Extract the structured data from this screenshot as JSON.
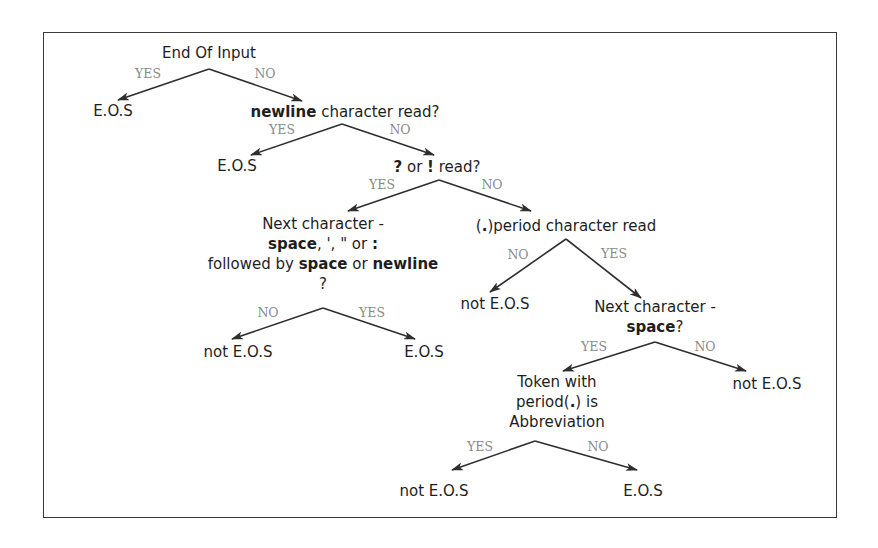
{
  "diagram": {
    "type": "decision-tree",
    "colors": {
      "frame": "#3a3a3a",
      "text": "#1e1e1e",
      "edge_label": "#8a8a8a",
      "edge": "#2e2e2e"
    },
    "nodes": [
      {
        "id": "n_end_of_input",
        "x": 209,
        "y": 43,
        "lines": [
          [
            {
              "t": "End Of Input"
            }
          ]
        ]
      },
      {
        "id": "n_eos_1",
        "x": 113,
        "y": 101,
        "lines": [
          [
            {
              "t": "E.O.S"
            }
          ]
        ]
      },
      {
        "id": "n_newline",
        "x": 345,
        "y": 102,
        "lines": [
          [
            {
              "t": "newline",
              "b": true
            },
            {
              "t": " character read?"
            }
          ]
        ]
      },
      {
        "id": "n_eos_2",
        "x": 237,
        "y": 156,
        "lines": [
          [
            {
              "t": "E.O.S"
            }
          ]
        ]
      },
      {
        "id": "n_qmark_excl",
        "x": 437,
        "y": 157,
        "lines": [
          [
            {
              "t": "?",
              "b": true
            },
            {
              "t": " or "
            },
            {
              "t": "!",
              "b": true
            },
            {
              "t": " read?"
            }
          ]
        ]
      },
      {
        "id": "n_next_char_1",
        "x": 323,
        "y": 214,
        "lines": [
          [
            {
              "t": "Next character -"
            }
          ],
          [
            {
              "t": "space",
              "b": true
            },
            {
              "t": ", ', \" or "
            },
            {
              "t": ":",
              "b": true
            }
          ],
          [
            {
              "t": "followed by "
            },
            {
              "t": "space",
              "b": true
            },
            {
              "t": " or "
            },
            {
              "t": "newline",
              "b": true
            }
          ],
          [
            {
              "t": "?"
            }
          ]
        ]
      },
      {
        "id": "n_period",
        "x": 566,
        "y": 216,
        "lines": [
          [
            {
              "t": "("
            },
            {
              "t": ".",
              "b": true
            },
            {
              "t": ")period character read"
            }
          ]
        ]
      },
      {
        "id": "n_not_eos_1",
        "x": 238,
        "y": 342,
        "lines": [
          [
            {
              "t": "not E.O.S"
            }
          ]
        ]
      },
      {
        "id": "n_eos_3",
        "x": 424,
        "y": 342,
        "lines": [
          [
            {
              "t": "E.O.S"
            }
          ]
        ]
      },
      {
        "id": "n_not_eos_2",
        "x": 495,
        "y": 294,
        "lines": [
          [
            {
              "t": "not E.O.S"
            }
          ]
        ]
      },
      {
        "id": "n_next_char_2",
        "x": 655,
        "y": 297,
        "lines": [
          [
            {
              "t": "Next character -"
            }
          ],
          [
            {
              "t": "space",
              "b": true
            },
            {
              "t": "?"
            }
          ]
        ]
      },
      {
        "id": "n_not_eos_3",
        "x": 767,
        "y": 374,
        "lines": [
          [
            {
              "t": "not E.O.S"
            }
          ]
        ]
      },
      {
        "id": "n_abbrev",
        "x": 557,
        "y": 372,
        "lines": [
          [
            {
              "t": "Token with"
            }
          ],
          [
            {
              "t": "period("
            },
            {
              "t": ".",
              "b": true
            },
            {
              "t": ") is"
            }
          ],
          [
            {
              "t": "Abbreviation"
            }
          ]
        ]
      },
      {
        "id": "n_not_eos_4",
        "x": 434,
        "y": 481,
        "lines": [
          [
            {
              "t": "not E.O.S"
            }
          ]
        ]
      },
      {
        "id": "n_eos_4",
        "x": 643,
        "y": 481,
        "lines": [
          [
            {
              "t": "E.O.S"
            }
          ]
        ]
      }
    ],
    "edges": [
      {
        "from": [
          209,
          69
        ],
        "to": [
          118,
          100
        ],
        "label": "YES",
        "lx": 148,
        "ly": 67
      },
      {
        "from": [
          209,
          69
        ],
        "to": [
          302,
          101
        ],
        "label": "NO",
        "lx": 265,
        "ly": 67
      },
      {
        "from": [
          342,
          124
        ],
        "to": [
          251,
          155
        ],
        "label": "YES",
        "lx": 282,
        "ly": 123
      },
      {
        "from": [
          342,
          124
        ],
        "to": [
          434,
          155
        ],
        "label": "NO",
        "lx": 400,
        "ly": 123
      },
      {
        "from": [
          439,
          180
        ],
        "to": [
          348,
          211
        ],
        "label": "YES",
        "lx": 382,
        "ly": 178
      },
      {
        "from": [
          439,
          180
        ],
        "to": [
          531,
          211
        ],
        "label": "NO",
        "lx": 492,
        "ly": 178
      },
      {
        "from": [
          566,
          239
        ],
        "to": [
          490,
          292
        ],
        "label": "NO",
        "lx": 518,
        "ly": 248
      },
      {
        "from": [
          566,
          239
        ],
        "to": [
          641,
          298
        ],
        "label": "YES",
        "lx": 614,
        "ly": 247
      },
      {
        "from": [
          323,
          308
        ],
        "to": [
          232,
          339
        ],
        "label": "NO",
        "lx": 268,
        "ly": 306
      },
      {
        "from": [
          323,
          308
        ],
        "to": [
          415,
          339
        ],
        "label": "YES",
        "lx": 372,
        "ly": 306
      },
      {
        "from": [
          655,
          342
        ],
        "to": [
          563,
          371
        ],
        "label": "YES",
        "lx": 594,
        "ly": 340
      },
      {
        "from": [
          655,
          342
        ],
        "to": [
          746,
          371
        ],
        "label": "NO",
        "lx": 705,
        "ly": 340
      },
      {
        "from": [
          535,
          441
        ],
        "to": [
          452,
          470
        ],
        "label": "YES",
        "lx": 480,
        "ly": 440
      },
      {
        "from": [
          535,
          441
        ],
        "to": [
          637,
          470
        ],
        "label": "NO",
        "lx": 598,
        "ly": 440
      }
    ]
  }
}
